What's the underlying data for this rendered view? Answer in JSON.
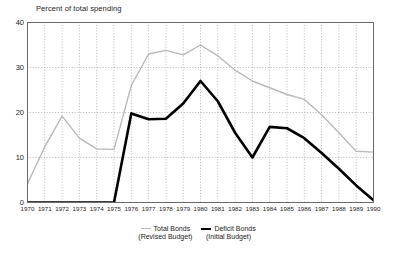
{
  "chart_data": {
    "type": "line",
    "title": "Percent of total spending",
    "xlabel": "",
    "ylabel": "Percent of total spending",
    "x": [
      1970,
      1971,
      1972,
      1973,
      1974,
      1975,
      1976,
      1977,
      1978,
      1979,
      1980,
      1981,
      1982,
      1983,
      1984,
      1985,
      1986,
      1987,
      1988,
      1989,
      1990
    ],
    "categories": [
      "1970",
      "1971",
      "1972",
      "1973",
      "1974",
      "1975",
      "1976",
      "1977",
      "1978",
      "1979",
      "1980",
      "1981",
      "1982",
      "1983",
      "1984",
      "1985",
      "1986",
      "1987",
      "1988",
      "1989",
      "1990"
    ],
    "ylim": [
      0,
      40
    ],
    "xlim": [
      1970,
      1990
    ],
    "yticks": [
      0,
      10,
      20,
      30,
      40
    ],
    "grid": true,
    "legend_position": "bottom-center",
    "series": [
      {
        "name": "Total Bonds",
        "sublabel": "(Revised Budget)",
        "color": "#b9b9b9",
        "width": 1.4,
        "values": [
          4.2,
          12.4,
          19.2,
          14.3,
          11.9,
          11.8,
          26.0,
          33.0,
          33.8,
          32.8,
          35.0,
          32.6,
          29.4,
          27.0,
          25.5,
          24.0,
          22.9,
          19.5,
          15.5,
          11.4,
          11.2
        ]
      },
      {
        "name": "Deficit Bonds",
        "sublabel": "(Initial Budget)",
        "color": "#000000",
        "width": 2.6,
        "values": [
          0,
          0,
          0,
          0,
          0,
          0,
          19.8,
          18.5,
          18.6,
          22.0,
          27.0,
          22.5,
          15.5,
          10.0,
          16.8,
          16.5,
          14.3,
          11.0,
          7.5,
          3.8,
          0.5
        ]
      }
    ]
  },
  "axis": {
    "ytick_labels": [
      "40",
      "30",
      "20",
      "10",
      "0"
    ],
    "title_text": "Percent of total spending"
  }
}
